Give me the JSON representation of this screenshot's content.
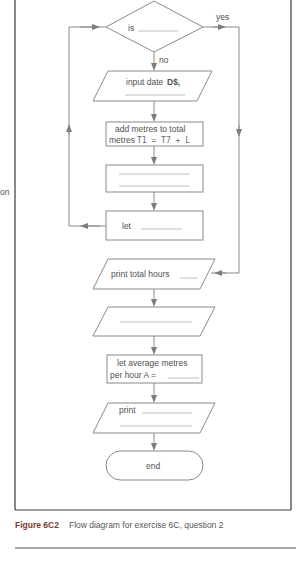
{
  "diagram": {
    "type": "flowchart",
    "decision": {
      "label": "is",
      "blank": "________",
      "yes_label": "yes",
      "no_label": "no"
    },
    "steps": [
      {
        "id": "input",
        "shape": "parallelogram",
        "line1": "input date",
        "var": "D$,",
        "line2": "________ ."
      },
      {
        "id": "add",
        "shape": "rectangle",
        "line1": "add metres to total",
        "line2_prefix": "metres",
        "line2_formula": "T1 = T7 + L"
      },
      {
        "id": "blank1",
        "shape": "rectangle",
        "line1": "",
        "line2": ""
      },
      {
        "id": "let",
        "shape": "rectangle",
        "line1": "let",
        "blank": "________"
      },
      {
        "id": "print_hours",
        "shape": "parallelogram",
        "line1": "print total hours",
        "blank": "_____"
      },
      {
        "id": "blank2",
        "shape": "parallelogram",
        "line1": ""
      },
      {
        "id": "avg",
        "shape": "rectangle",
        "line1": "let average metres",
        "line2": "per hour A =",
        "blank": "______"
      },
      {
        "id": "print",
        "shape": "parallelogram",
        "line1": "print",
        "blank": "__________"
      },
      {
        "id": "end",
        "shape": "terminator",
        "line1": "end"
      }
    ]
  },
  "margin_fragment": "on",
  "caption": {
    "figure_label": "Figure 6C2",
    "text": "Flow diagram for exercise 6C, question 2"
  },
  "colors": {
    "line": "#8a8a8a",
    "frame": "#3a3a3a",
    "figure_label": "#7a3b2e"
  }
}
